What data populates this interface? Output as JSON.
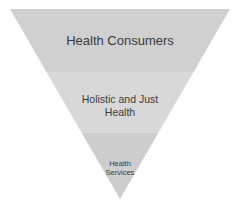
{
  "diagram": {
    "type": "inverted-pyramid",
    "levels": [
      {
        "label": "Health Consumers",
        "color": "#d0d0d0"
      },
      {
        "label": "Holistic and Just Health",
        "color": "#d8d8d8"
      },
      {
        "label": "Health Services",
        "color": "#cdcdcd"
      }
    ],
    "label_lines": {
      "level0": [
        "Health Consumers"
      ],
      "level1": [
        "Holistic and Just",
        "Health"
      ],
      "level2": [
        "Health",
        "Services"
      ]
    }
  }
}
